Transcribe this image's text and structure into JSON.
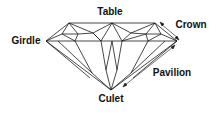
{
  "diagram": {
    "labels": {
      "table": "Table",
      "crown": "Crown",
      "girdle": "Girdle",
      "pavilion": "Pavilion",
      "culet": "Culet"
    },
    "colors": {
      "line": "#1a1a1a",
      "background": "#ffffff"
    }
  }
}
